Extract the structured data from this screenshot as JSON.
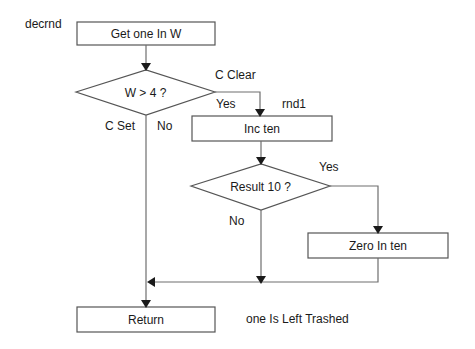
{
  "diagram": {
    "type": "flowchart",
    "entry_label": "decrnd",
    "nodes": [
      {
        "id": "get_one",
        "shape": "process",
        "label": "Get one In W"
      },
      {
        "id": "w_gt_4",
        "shape": "decision",
        "label": "W > 4 ?"
      },
      {
        "id": "inc_ten",
        "shape": "process",
        "label": "Inc ten"
      },
      {
        "id": "result_10",
        "shape": "decision",
        "label": "Result 10 ?"
      },
      {
        "id": "zero_ten",
        "shape": "process",
        "label": "Zero In ten"
      },
      {
        "id": "return",
        "shape": "process",
        "label": "Return"
      }
    ],
    "edge_labels": {
      "c_clear": "C Clear",
      "yes1": "Yes",
      "c_set": "C Set",
      "no1": "No",
      "rnd1": "rnd1",
      "yes2": "Yes",
      "no2": "No"
    },
    "note": "one Is Left Trashed",
    "line_color": "#6e6e6e",
    "border_color": "#555555"
  }
}
